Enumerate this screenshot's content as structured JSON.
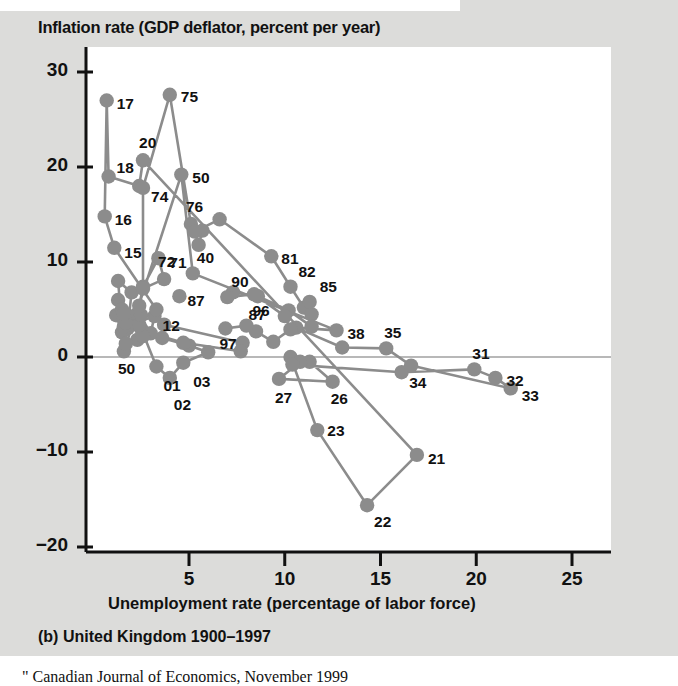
{
  "figure": {
    "caption": "(b) United Kingdom 1900–1997",
    "source_note": "\" Canadian Journal of Economics, November 1999"
  },
  "colors": {
    "page_background": "#dcdcda",
    "plot_background": "#ffffff",
    "marker": "#8c8c8c",
    "line": "#8c8c8c",
    "axis": "#111111",
    "zero_line": "#b8b8b8",
    "text": "#111111"
  },
  "chart_data": {
    "type": "scatter",
    "title": "Inflation rate (GDP deflator, percent per year)",
    "xlabel": "Unemployment rate (percentage of labor force)",
    "ylabel": "Inflation rate (GDP deflator, percent per year)",
    "xlim": [
      0,
      26.5
    ],
    "ylim": [
      -20,
      32
    ],
    "xticks": [
      5,
      10,
      15,
      20,
      25
    ],
    "yticks": [
      30,
      20,
      10,
      0,
      -10,
      -20
    ],
    "xtick_labels": [
      "5",
      "10",
      "15",
      "20",
      "25"
    ],
    "ytick_labels": [
      "30",
      "20",
      "10",
      "0",
      "-10",
      "-20"
    ],
    "grid": false,
    "zero_reference_line": true,
    "legend": "none",
    "connected": true,
    "series_name": "United Kingdom 1900-1997",
    "points": [
      {
        "label": "00",
        "x": 2.5,
        "y": 3.0,
        "lab": ""
      },
      {
        "label": "01",
        "x": 3.3,
        "y": -1.0,
        "lab": "01",
        "lx": 7,
        "ly": 12
      },
      {
        "label": "02",
        "x": 4.0,
        "y": -2.2,
        "lab": "02",
        "lx": 4,
        "ly": 20
      },
      {
        "label": "03",
        "x": 4.7,
        "y": -0.6,
        "lab": "03",
        "lx": 10,
        "ly": 12
      },
      {
        "label": "04",
        "x": 6.0,
        "y": 0.5,
        "lab": ""
      },
      {
        "label": "05",
        "x": 5.0,
        "y": 1.2,
        "lab": ""
      },
      {
        "label": "06",
        "x": 3.6,
        "y": 2.0,
        "lab": ""
      },
      {
        "label": "07",
        "x": 3.7,
        "y": 3.4,
        "lab": ""
      },
      {
        "label": "08",
        "x": 7.8,
        "y": 1.5,
        "lab": ""
      },
      {
        "label": "09",
        "x": 7.7,
        "y": 0.6,
        "lab": ""
      },
      {
        "label": "10",
        "x": 4.7,
        "y": 1.5,
        "lab": ""
      },
      {
        "label": "11",
        "x": 3.0,
        "y": 2.5,
        "lab": ""
      },
      {
        "label": "12",
        "x": 3.2,
        "y": 4.3,
        "lab": "12",
        "lx": 8,
        "ly": 3
      },
      {
        "label": "13",
        "x": 2.1,
        "y": 3.5,
        "lab": ""
      },
      {
        "label": "14",
        "x": 3.3,
        "y": 5.0,
        "lab": ""
      },
      {
        "label": "15",
        "x": 1.1,
        "y": 11.5,
        "lab": "15",
        "lx": 10,
        "ly": -2
      },
      {
        "label": "16",
        "x": 0.6,
        "y": 14.8,
        "lab": "16",
        "lx": 10,
        "ly": -3
      },
      {
        "label": "17",
        "x": 0.7,
        "y": 27.0,
        "lab": "17",
        "lx": 10,
        "ly": -4
      },
      {
        "label": "18",
        "x": 0.8,
        "y": 19.0,
        "lab": "18",
        "lx": 8,
        "ly": -16
      },
      {
        "label": "19",
        "x": 2.4,
        "y": 18.0,
        "lab": ""
      },
      {
        "label": "20",
        "x": 2.6,
        "y": 20.7,
        "lab": "20",
        "lx": -4,
        "ly": -24
      },
      {
        "label": "21",
        "x": 16.9,
        "y": -10.3,
        "lab": "21",
        "lx": 11,
        "ly": -3
      },
      {
        "label": "22",
        "x": 14.3,
        "y": -15.6,
        "lab": "22",
        "lx": 7,
        "ly": 10
      },
      {
        "label": "23",
        "x": 11.7,
        "y": -7.7,
        "lab": "23",
        "lx": 10,
        "ly": -6
      },
      {
        "label": "24",
        "x": 10.3,
        "y": 0.0,
        "lab": ""
      },
      {
        "label": "25",
        "x": 11.3,
        "y": -0.5,
        "lab": ""
      },
      {
        "label": "26",
        "x": 12.5,
        "y": -2.6,
        "lab": "26",
        "lx": -2,
        "ly": 10
      },
      {
        "label": "27",
        "x": 9.7,
        "y": -2.3,
        "lab": "27",
        "lx": -4,
        "ly": 12
      },
      {
        "label": "28",
        "x": 10.8,
        "y": -0.5,
        "lab": ""
      },
      {
        "label": "29",
        "x": 10.4,
        "y": -0.8,
        "lab": ""
      },
      {
        "label": "30",
        "x": 16.1,
        "y": -1.6,
        "lab": ""
      },
      {
        "label": "31",
        "x": 19.9,
        "y": -1.3,
        "lab": "31",
        "lx": -2,
        "ly": -22
      },
      {
        "label": "32",
        "x": 21.0,
        "y": -2.2,
        "lab": "32",
        "lx": 11,
        "ly": -4
      },
      {
        "label": "33",
        "x": 21.8,
        "y": -3.3,
        "lab": "33",
        "lx": 11,
        "ly": 1
      },
      {
        "label": "34",
        "x": 16.6,
        "y": -0.9,
        "lab": "34",
        "lx": -2,
        "ly": 10
      },
      {
        "label": "35",
        "x": 15.3,
        "y": 0.9,
        "lab": "35",
        "lx": -2,
        "ly": -22
      },
      {
        "label": "36",
        "x": 13.0,
        "y": 1.0,
        "lab": ""
      },
      {
        "label": "37",
        "x": 10.6,
        "y": 3.1,
        "lab": ""
      },
      {
        "label": "38",
        "x": 12.7,
        "y": 2.8,
        "lab": "38",
        "lx": 11,
        "ly": -3
      },
      {
        "label": "40",
        "x": 5.2,
        "y": 8.8,
        "lab": "40",
        "lx": 4,
        "ly": -22
      },
      {
        "label": "50",
        "x": 4.6,
        "y": 19.2,
        "lab": "50",
        "lx": 11,
        "ly": -4
      },
      {
        "label": "50b",
        "x": 1.6,
        "y": 0.6,
        "lab": "50",
        "lx": -6,
        "ly": 11
      },
      {
        "label": "51",
        "x": 1.3,
        "y": 8.0,
        "lab": ""
      },
      {
        "label": "52",
        "x": 2.0,
        "y": 6.8,
        "lab": ""
      },
      {
        "label": "53",
        "x": 1.8,
        "y": 3.0,
        "lab": ""
      },
      {
        "label": "54",
        "x": 1.5,
        "y": 2.6,
        "lab": ""
      },
      {
        "label": "55",
        "x": 1.2,
        "y": 4.4,
        "lab": ""
      },
      {
        "label": "56",
        "x": 1.3,
        "y": 6.0,
        "lab": ""
      },
      {
        "label": "57",
        "x": 1.6,
        "y": 4.0,
        "lab": ""
      },
      {
        "label": "58",
        "x": 2.2,
        "y": 4.4,
        "lab": ""
      },
      {
        "label": "59",
        "x": 2.3,
        "y": 1.8,
        "lab": ""
      },
      {
        "label": "60",
        "x": 1.7,
        "y": 1.4,
        "lab": ""
      },
      {
        "label": "61",
        "x": 1.6,
        "y": 3.2,
        "lab": ""
      },
      {
        "label": "62",
        "x": 2.1,
        "y": 4.2,
        "lab": ""
      },
      {
        "label": "63",
        "x": 2.6,
        "y": 2.2,
        "lab": ""
      },
      {
        "label": "64",
        "x": 1.7,
        "y": 3.6,
        "lab": ""
      },
      {
        "label": "65",
        "x": 1.5,
        "y": 5.0,
        "lab": ""
      },
      {
        "label": "66",
        "x": 1.6,
        "y": 4.6,
        "lab": ""
      },
      {
        "label": "67",
        "x": 2.4,
        "y": 3.4,
        "lab": ""
      },
      {
        "label": "68",
        "x": 2.5,
        "y": 4.4,
        "lab": ""
      },
      {
        "label": "69",
        "x": 2.4,
        "y": 5.4,
        "lab": ""
      },
      {
        "label": "70",
        "x": 2.6,
        "y": 7.4,
        "lab": ""
      },
      {
        "label": "71",
        "x": 3.4,
        "y": 10.4,
        "lab": "71",
        "lx": 11,
        "ly": -2
      },
      {
        "label": "72",
        "x": 3.7,
        "y": 8.2,
        "lab": "72",
        "lx": -6,
        "ly": -24
      },
      {
        "label": "73",
        "x": 2.6,
        "y": 7.2,
        "lab": ""
      },
      {
        "label": "74",
        "x": 2.6,
        "y": 17.8,
        "lab": "74",
        "lx": 8,
        "ly": 2
      },
      {
        "label": "75",
        "x": 4.0,
        "y": 27.6,
        "lab": "75",
        "lx": 11,
        "ly": -5
      },
      {
        "label": "76",
        "x": 5.1,
        "y": 14.0,
        "lab": "76",
        "lx": -5,
        "ly": -24
      },
      {
        "label": "77",
        "x": 5.7,
        "y": 13.3,
        "lab": ""
      },
      {
        "label": "78",
        "x": 5.5,
        "y": 11.8,
        "lab": ""
      },
      {
        "label": "79",
        "x": 5.3,
        "y": 13.2,
        "lab": ""
      },
      {
        "label": "80",
        "x": 6.6,
        "y": 14.5,
        "lab": ""
      },
      {
        "label": "81",
        "x": 9.3,
        "y": 10.6,
        "lab": "81",
        "lx": 10,
        "ly": -4
      },
      {
        "label": "82",
        "x": 10.3,
        "y": 7.4,
        "lab": "82",
        "lx": 8,
        "ly": -22
      },
      {
        "label": "83",
        "x": 11.0,
        "y": 5.2,
        "lab": ""
      },
      {
        "label": "84",
        "x": 11.4,
        "y": 4.5,
        "lab": ""
      },
      {
        "label": "85",
        "x": 11.3,
        "y": 5.8,
        "lab": "85",
        "lx": 10,
        "ly": -22
      },
      {
        "label": "86",
        "x": 11.4,
        "y": 3.2,
        "lab": ""
      },
      {
        "label": "87",
        "x": 10.2,
        "y": 4.9,
        "lab": "87",
        "lx": -40,
        "ly": -2
      },
      {
        "label": "87b",
        "x": 4.5,
        "y": 6.4,
        "lab": "87",
        "lx": 8,
        "ly": -2
      },
      {
        "label": "88",
        "x": 8.6,
        "y": 6.4,
        "lab": ""
      },
      {
        "label": "89",
        "x": 7.3,
        "y": 6.8,
        "lab": ""
      },
      {
        "label": "90",
        "x": 7.0,
        "y": 6.3,
        "lab": "90",
        "lx": 4,
        "ly": -22
      },
      {
        "label": "91",
        "x": 8.4,
        "y": 6.6,
        "lab": ""
      },
      {
        "label": "92",
        "x": 10.0,
        "y": 4.3,
        "lab": ""
      },
      {
        "label": "93",
        "x": 10.3,
        "y": 2.9,
        "lab": ""
      },
      {
        "label": "94",
        "x": 9.4,
        "y": 1.6,
        "lab": ""
      },
      {
        "label": "95",
        "x": 8.5,
        "y": 2.7,
        "lab": ""
      },
      {
        "label": "96",
        "x": 8.0,
        "y": 3.3,
        "lab": "96",
        "lx": 6,
        "ly": -22
      },
      {
        "label": "97",
        "x": 6.9,
        "y": 3.0,
        "lab": "97",
        "lx": -6,
        "ly": 8
      }
    ],
    "path_order": [
      "00",
      "01",
      "02",
      "03",
      "04",
      "05",
      "06",
      "07",
      "08",
      "09",
      "10",
      "11",
      "12",
      "13",
      "14",
      "15",
      "16",
      "17",
      "18",
      "19",
      "20",
      "21",
      "22",
      "23",
      "24",
      "25",
      "26",
      "27",
      "28",
      "29",
      "30",
      "31",
      "32",
      "33",
      "34",
      "35",
      "36",
      "37",
      "38",
      "40",
      "50",
      "50b",
      "51",
      "52",
      "53",
      "54",
      "55",
      "56",
      "57",
      "58",
      "59",
      "60",
      "61",
      "62",
      "63",
      "64",
      "65",
      "66",
      "67",
      "68",
      "69",
      "70",
      "71",
      "72",
      "73",
      "74",
      "75",
      "76",
      "77",
      "78",
      "79",
      "80",
      "81",
      "82",
      "83",
      "84",
      "85",
      "86",
      "87",
      "88",
      "89",
      "90",
      "91",
      "92",
      "93",
      "94",
      "95",
      "96",
      "97"
    ]
  }
}
